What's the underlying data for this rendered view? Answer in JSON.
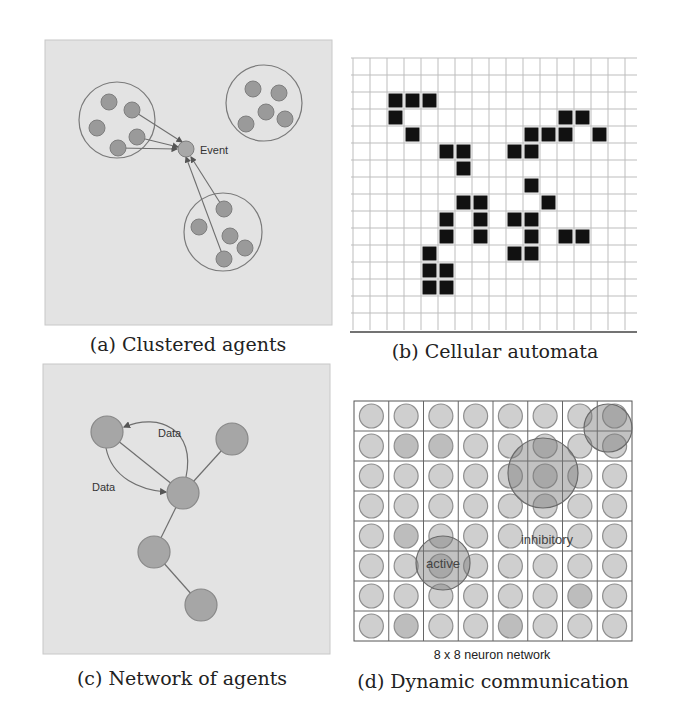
{
  "figure": {
    "panels": [
      {
        "id": "a",
        "caption": "(a) Clustered agents",
        "event_label": "Event",
        "background": "#e3e3e3",
        "cluster_circles": [
          {
            "cx": 117,
            "cy": 120,
            "r": 38
          },
          {
            "cx": 264,
            "cy": 103,
            "r": 38
          },
          {
            "cx": 223,
            "cy": 232,
            "r": 39
          }
        ],
        "agents": [
          {
            "cx": 109,
            "cy": 102
          },
          {
            "cx": 132,
            "cy": 110
          },
          {
            "cx": 97,
            "cy": 128
          },
          {
            "cx": 137,
            "cy": 137
          },
          {
            "cx": 118,
            "cy": 148
          },
          {
            "cx": 253,
            "cy": 89
          },
          {
            "cx": 279,
            "cy": 93
          },
          {
            "cx": 266,
            "cy": 112
          },
          {
            "cx": 246,
            "cy": 124
          },
          {
            "cx": 285,
            "cy": 119
          },
          {
            "cx": 224,
            "cy": 209
          },
          {
            "cx": 199,
            "cy": 227
          },
          {
            "cx": 230,
            "cy": 236
          },
          {
            "cx": 245,
            "cy": 248
          },
          {
            "cx": 224,
            "cy": 259
          }
        ],
        "event": {
          "cx": 186,
          "cy": 149,
          "r": 8
        },
        "arrows": [
          {
            "x1": 132,
            "y1": 110,
            "x2": 182,
            "y2": 142
          },
          {
            "x1": 137,
            "y1": 137,
            "x2": 178,
            "y2": 147
          },
          {
            "x1": 118,
            "y1": 148,
            "x2": 177,
            "y2": 149
          },
          {
            "x1": 224,
            "y1": 209,
            "x2": 191,
            "y2": 157
          },
          {
            "x1": 224,
            "y1": 259,
            "x2": 186,
            "y2": 157
          }
        ]
      },
      {
        "id": "b",
        "caption": "(b) Cellular automata",
        "grid": {
          "cols": 16,
          "rows": 16,
          "cell": 17,
          "x0": 353,
          "y0": 58
        },
        "live_cells": [
          [
            2,
            2
          ],
          [
            2,
            3
          ],
          [
            2,
            4
          ],
          [
            3,
            2
          ],
          [
            3,
            12
          ],
          [
            3,
            13
          ],
          [
            4,
            3
          ],
          [
            4,
            10
          ],
          [
            4,
            11
          ],
          [
            4,
            12
          ],
          [
            4,
            14
          ],
          [
            5,
            5
          ],
          [
            5,
            6
          ],
          [
            5,
            9
          ],
          [
            5,
            10
          ],
          [
            6,
            6
          ],
          [
            7,
            10
          ],
          [
            8,
            6
          ],
          [
            8,
            7
          ],
          [
            8,
            11
          ],
          [
            9,
            5
          ],
          [
            9,
            7
          ],
          [
            9,
            9
          ],
          [
            9,
            10
          ],
          [
            10,
            5
          ],
          [
            10,
            7
          ],
          [
            10,
            10
          ],
          [
            10,
            12
          ],
          [
            10,
            13
          ],
          [
            11,
            4
          ],
          [
            11,
            9
          ],
          [
            11,
            10
          ],
          [
            12,
            4
          ],
          [
            12,
            5
          ],
          [
            13,
            4
          ],
          [
            13,
            5
          ]
        ]
      },
      {
        "id": "c",
        "caption": "(c) Network of agents",
        "background": "#e3e3e3",
        "edge_labels": [
          {
            "text": "Data",
            "x": 172,
            "y": 437
          },
          {
            "text": "Data",
            "x": 106,
            "y": 490
          }
        ],
        "nodes": [
          {
            "name": "A",
            "cx": 107,
            "cy": 432
          },
          {
            "name": "B",
            "cx": 232,
            "cy": 439
          },
          {
            "name": "C",
            "cx": 183,
            "cy": 493
          },
          {
            "name": "D",
            "cx": 154,
            "cy": 552
          },
          {
            "name": "E",
            "cx": 201,
            "cy": 605
          }
        ]
      },
      {
        "id": "d",
        "caption": "(d) Dynamic communication",
        "subcaption": "8 x 8 neuron network",
        "grid": {
          "cols": 8,
          "rows": 8,
          "cell_w": 34.75,
          "cell_h": 30,
          "x0": 354,
          "y0": 401
        },
        "active_label": "active",
        "inhibitory_label": "inhibitory",
        "regions": [
          {
            "kind": "top-right",
            "cx": 608,
            "cy": 428,
            "r": 24
          },
          {
            "kind": "inhibitory",
            "cx": 543,
            "cy": 473,
            "r": 35
          },
          {
            "kind": "active",
            "cx": 443,
            "cy": 563,
            "r": 27
          }
        ]
      }
    ]
  },
  "colors": {
    "panel_bg": "#e3e3e3",
    "agent_fill": "#a4a4a4",
    "agent_stroke": "#7e7e7e",
    "line": "#6f6f6f",
    "grid_line": "#bdbdbd",
    "cell_live": "#111111",
    "neuron_fill": "#cfcfcf",
    "neuron_stroke": "#8f8f8f",
    "region_fill": "rgba(120,120,120,0.45)",
    "region_stroke": "#6a6a6a"
  }
}
